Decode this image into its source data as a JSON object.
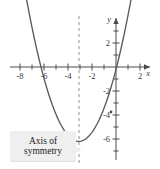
{
  "figure": {
    "title": "",
    "callout": {
      "line1": "Axis of",
      "line2": "symmetry",
      "background_color": "#efeff0",
      "text_color": "#1c1c1c"
    },
    "colors": {
      "curve": "#5a5a5a",
      "axis": "#4a4a4a",
      "dashed_line": "#8d8d8d",
      "background": "#ffffff"
    }
  },
  "chart_data": {
    "type": "line",
    "title": "",
    "xlabel": "x",
    "ylabel": "y",
    "xlim": [
      -9.6,
      3.4
    ],
    "ylim": [
      -7.6,
      5.2
    ],
    "grid": false,
    "legend": null,
    "x_ticks": [
      -8,
      -6,
      -4,
      -2,
      2
    ],
    "x_tick_labels": [
      "-8",
      "-6",
      "-4",
      "-2",
      "2"
    ],
    "x_minor_ticks": [
      -9,
      -7,
      -5,
      -3,
      -1,
      1,
      3
    ],
    "y_ticks": [
      2,
      -2,
      -4,
      -6
    ],
    "y_tick_labels": [
      "2",
      "-2",
      "-4",
      "-6"
    ],
    "y_minor_ticks": [
      1,
      3,
      4,
      -1,
      -3,
      -5,
      -7
    ],
    "series": [
      {
        "name": "parabola",
        "equation": "y = 0.36(x + 3.1)^2 - 6.2",
        "vertex": [
          -3.1,
          -6.2
        ],
        "axis_of_symmetry": -3.1,
        "x_intercepts": [
          -6.25,
          0.05
        ],
        "y_intercept": -2.75,
        "x": [
          -9.0,
          -8.5,
          -8.0,
          -7.5,
          -7.0,
          -6.5,
          -6.0,
          -5.5,
          -5.0,
          -4.5,
          -4.0,
          -3.5,
          -3.0,
          -2.5,
          -2.0,
          -1.5,
          -1.0,
          -0.5,
          0.0,
          0.5,
          1.0,
          1.5,
          2.0,
          2.4
        ],
        "y": [
          6.8,
          5.1,
          3.5,
          2.1,
          0.9,
          -0.1,
          -1.0,
          -1.8,
          -2.4,
          -2.9,
          -3.3,
          -3.5,
          -6.15,
          -5.9,
          -5.6,
          -5.1,
          -4.5,
          -3.8,
          -2.9,
          -1.9,
          -0.8,
          0.5,
          2.0,
          3.3
        ]
      }
    ],
    "annotations": [
      {
        "name": "axis-of-symmetry-line",
        "type": "vline",
        "x": -3.1,
        "style": "dashed"
      },
      {
        "name": "axis-of-symmetry-label",
        "type": "callout",
        "text": "Axis of symmetry"
      }
    ]
  }
}
